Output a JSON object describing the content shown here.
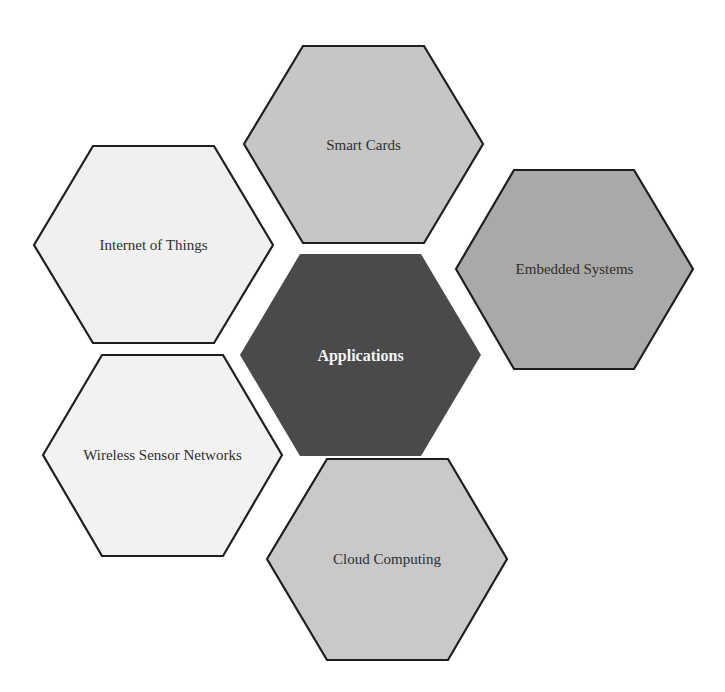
{
  "diagram": {
    "type": "hexagon-cluster",
    "center": {
      "label": "Applications",
      "fill": "#4a4a4a",
      "text_color": "#f4f4f4",
      "points": "240,355 300,254 421,254 481,355 421,456 300,456"
    },
    "nodes": [
      {
        "id": "smart-cards",
        "label": "Smart Cards",
        "fill": "#c6c6c6",
        "points": "244,144 303,46 424,46 483,144 424,243 303,243"
      },
      {
        "id": "internet-of-things",
        "label": "Internet of Things",
        "fill": "#f0f0f0",
        "points": "34,245 93,146 214,146 273,245 214,343 93,343"
      },
      {
        "id": "embedded-systems",
        "label": "Embedded Systems",
        "fill": "#a9a9a9",
        "points": "456,269 514,170 634,170 693,269 634,369 514,369"
      },
      {
        "id": "wireless-sensor-networks",
        "label": "Wireless Sensor Networks",
        "fill": "#f2f2f2",
        "points": "43,455 102,355 223,355 282,455 223,556 102,556"
      },
      {
        "id": "cloud-computing",
        "label": "Cloud Computing",
        "fill": "#c9c9c9",
        "points": "267,559 327,459 448,459 507,559 448,660 327,660"
      }
    ],
    "stroke_color": "#1e1e1e"
  }
}
